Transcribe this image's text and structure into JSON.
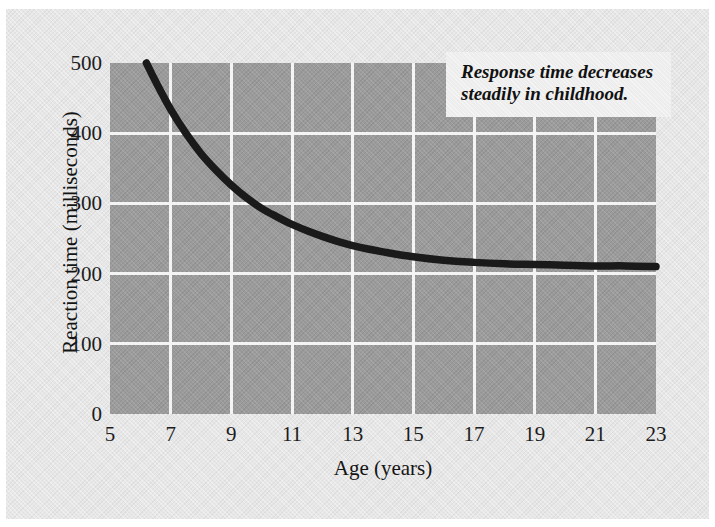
{
  "figure": {
    "annotation": "Response time decreases steadily in childhood.",
    "plot_fill_color": "#9b9b9b",
    "grid_color": "#f4f4f4",
    "curve_color": "#1a1a1a",
    "background_color": "#e7e7e7"
  },
  "chart_data": {
    "type": "line",
    "title": "",
    "subtitle": "",
    "xlabel": "Age (years)",
    "ylabel": "Reaction time (milliseconds)",
    "xlim": [
      5,
      23
    ],
    "ylim": [
      0,
      500
    ],
    "xticks": [
      5,
      7,
      9,
      11,
      13,
      15,
      17,
      19,
      21,
      23
    ],
    "xtick_labels": [
      "5",
      "7",
      "9",
      "11",
      "13",
      "15",
      "17",
      "19",
      "21",
      "23"
    ],
    "yticks": [
      0,
      100,
      200,
      300,
      400,
      500
    ],
    "ytick_labels": [
      "0",
      "100",
      "200",
      "300",
      "400",
      "500"
    ],
    "grid": true,
    "grid_color": "#f4f4f4",
    "legend": null,
    "legend_position": "none",
    "annotations": [
      {
        "text": "Response time decreases steadily in childhood.",
        "position": "top-right"
      }
    ],
    "series": [
      {
        "name": "Reaction time",
        "color": "#1a1a1a",
        "x": [
          6.2,
          6.5,
          7,
          7.5,
          8,
          8.5,
          9,
          9.5,
          10,
          10.5,
          11,
          11.5,
          12,
          12.5,
          13,
          13.5,
          14,
          15,
          16,
          17,
          18,
          19,
          20,
          21,
          22,
          23
        ],
        "y": [
          500,
          474,
          434,
          400,
          371,
          347,
          326,
          308,
          293,
          281,
          270,
          261,
          253,
          246,
          240,
          235,
          231,
          224,
          219,
          216,
          214,
          213,
          212,
          211,
          211,
          210
        ]
      }
    ]
  }
}
